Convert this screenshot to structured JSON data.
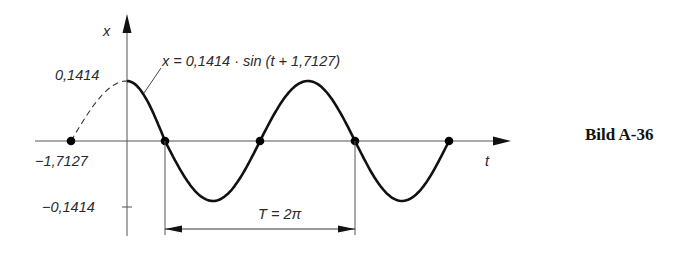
{
  "figure": {
    "caption": "Bild A-36",
    "axis_labels": {
      "x_axis": "t",
      "y_axis": "x"
    },
    "equation_label": "x = 0,1414 · sin (t + 1,7127)",
    "tick_labels": {
      "amplitude_pos": "0,1414",
      "amplitude_neg": "−0,1414",
      "phase_shift": "−1,7127"
    },
    "period_label": "T = 2π"
  },
  "chart_data": {
    "type": "line",
    "title": "x = 0,1414 · sin (t + 1,7127)",
    "xlabel": "t",
    "ylabel": "x",
    "function": {
      "amplitude": 0.1414,
      "phase": 1.7127,
      "angular_frequency": 1
    },
    "dashed_segment_t": [
      -1.7127,
      0
    ],
    "solid_segment_t": [
      0,
      9.0
    ],
    "marked_points": [
      {
        "t": -1.7127,
        "x": 0
      },
      {
        "t": 3.1416,
        "x": 0,
        "note": "zero crossing"
      },
      {
        "t": 6.2832,
        "x": 0,
        "note": "zero crossing"
      },
      {
        "t": 9.4248,
        "x": 0,
        "note": "zero crossing"
      },
      {
        "t": 12.566,
        "x": 0,
        "note": "zero crossing"
      }
    ],
    "period": "2π",
    "y_ticks": [
      0.1414,
      -0.1414
    ],
    "x_ticks": [
      -1.7127
    ],
    "grid": false,
    "legend": "none"
  }
}
